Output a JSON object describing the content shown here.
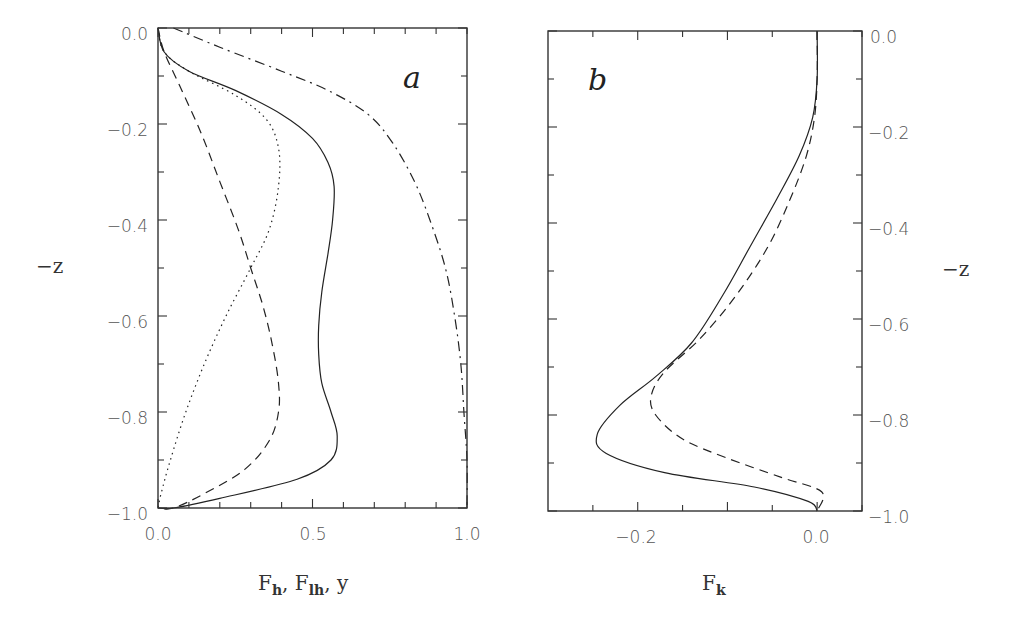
{
  "figure": {
    "panels": [
      {
        "id": "a",
        "letter": "a",
        "xlabel": {
          "main1": "F",
          "sub1": "h",
          "sep1": ", ",
          "main2": "F",
          "sub2": "lh",
          "sep2": ", ",
          "main3": "y"
        },
        "ylabel": "−z",
        "xticks": [
          "0.0",
          "0.5",
          "1.0"
        ],
        "yticks": [
          "0.0",
          "−0.2",
          "−0.4",
          "−0.6",
          "−0.8",
          "−1.0"
        ]
      },
      {
        "id": "b",
        "letter": "b",
        "xlabel": {
          "main1": "F",
          "sub1": "k"
        },
        "ylabel": "−z",
        "xticks": [
          "−0.2",
          "0.0"
        ],
        "yticks": [
          "0.0",
          "−0.2",
          "−0.4",
          "−0.6",
          "−0.8",
          "−1.0"
        ]
      }
    ]
  },
  "chart_data": [
    {
      "type": "line",
      "panel": "a",
      "title": "a",
      "xlabel": "F_h, F_lh, y",
      "ylabel": "-z",
      "xlim": [
        0.0,
        1.0
      ],
      "ylim": [
        -1.0,
        0.0
      ],
      "grid": false,
      "legend": "none",
      "x_ticks": [
        0.0,
        0.5,
        1.0
      ],
      "y_ticks": [
        0.0,
        -0.2,
        -0.4,
        -0.6,
        -0.8,
        -1.0
      ],
      "series": [
        {
          "name": "solid",
          "style": "solid",
          "points": [
            [
              0.0,
              0.0
            ],
            [
              0.02,
              -0.05
            ],
            [
              0.1,
              -0.09
            ],
            [
              0.25,
              -0.13
            ],
            [
              0.4,
              -0.18
            ],
            [
              0.5,
              -0.23
            ],
            [
              0.55,
              -0.28
            ],
            [
              0.57,
              -0.33
            ],
            [
              0.565,
              -0.4
            ],
            [
              0.55,
              -0.47
            ],
            [
              0.53,
              -0.55
            ],
            [
              0.52,
              -0.62
            ],
            [
              0.52,
              -0.68
            ],
            [
              0.53,
              -0.74
            ],
            [
              0.56,
              -0.8
            ],
            [
              0.58,
              -0.85
            ],
            [
              0.56,
              -0.9
            ],
            [
              0.45,
              -0.94
            ],
            [
              0.2,
              -0.98
            ],
            [
              0.05,
              -1.0
            ],
            [
              0.0,
              -1.0
            ]
          ]
        },
        {
          "name": "dashed",
          "style": "dashed",
          "points": [
            [
              0.0,
              0.0
            ],
            [
              0.02,
              -0.05
            ],
            [
              0.07,
              -0.12
            ],
            [
              0.14,
              -0.22
            ],
            [
              0.2,
              -0.32
            ],
            [
              0.26,
              -0.42
            ],
            [
              0.3,
              -0.5
            ],
            [
              0.34,
              -0.58
            ],
            [
              0.37,
              -0.66
            ],
            [
              0.39,
              -0.74
            ],
            [
              0.39,
              -0.8
            ],
            [
              0.36,
              -0.86
            ],
            [
              0.28,
              -0.92
            ],
            [
              0.15,
              -0.97
            ],
            [
              0.05,
              -1.0
            ],
            [
              0.0,
              -1.0
            ]
          ]
        },
        {
          "name": "dotted",
          "style": "dotted",
          "points": [
            [
              0.0,
              0.0
            ],
            [
              0.02,
              -0.05
            ],
            [
              0.1,
              -0.09
            ],
            [
              0.25,
              -0.14
            ],
            [
              0.35,
              -0.19
            ],
            [
              0.39,
              -0.25
            ],
            [
              0.39,
              -0.33
            ],
            [
              0.36,
              -0.42
            ],
            [
              0.3,
              -0.5
            ],
            [
              0.22,
              -0.6
            ],
            [
              0.15,
              -0.7
            ],
            [
              0.09,
              -0.8
            ],
            [
              0.04,
              -0.9
            ],
            [
              0.01,
              -0.97
            ],
            [
              0.0,
              -1.0
            ]
          ]
        },
        {
          "name": "dash-dot",
          "style": "dashdot",
          "points": [
            [
              0.05,
              0.0
            ],
            [
              0.2,
              -0.04
            ],
            [
              0.4,
              -0.09
            ],
            [
              0.55,
              -0.13
            ],
            [
              0.68,
              -0.18
            ],
            [
              0.76,
              -0.24
            ],
            [
              0.83,
              -0.32
            ],
            [
              0.88,
              -0.4
            ],
            [
              0.93,
              -0.5
            ],
            [
              0.96,
              -0.6
            ],
            [
              0.98,
              -0.7
            ],
            [
              0.99,
              -0.8
            ],
            [
              1.0,
              -0.9
            ],
            [
              1.0,
              -1.0
            ]
          ]
        }
      ]
    },
    {
      "type": "line",
      "panel": "b",
      "title": "b",
      "xlabel": "F_k",
      "ylabel": "-z",
      "xlim": [
        -0.3,
        0.05
      ],
      "ylim": [
        -1.0,
        0.0
      ],
      "grid": false,
      "legend": "none",
      "x_ticks": [
        -0.2,
        0.0
      ],
      "y_ticks": [
        0.0,
        -0.2,
        -0.4,
        -0.6,
        -0.8,
        -1.0
      ],
      "series": [
        {
          "name": "solid",
          "style": "solid",
          "points": [
            [
              0.0,
              0.0
            ],
            [
              0.0,
              -0.1
            ],
            [
              -0.005,
              -0.18
            ],
            [
              -0.02,
              -0.26
            ],
            [
              -0.045,
              -0.35
            ],
            [
              -0.075,
              -0.45
            ],
            [
              -0.105,
              -0.55
            ],
            [
              -0.14,
              -0.65
            ],
            [
              -0.18,
              -0.72
            ],
            [
              -0.22,
              -0.78
            ],
            [
              -0.245,
              -0.84
            ],
            [
              -0.235,
              -0.88
            ],
            [
              -0.17,
              -0.92
            ],
            [
              -0.07,
              -0.95
            ],
            [
              -0.01,
              -0.98
            ],
            [
              0.0,
              -1.0
            ]
          ]
        },
        {
          "name": "dashed",
          "style": "dashed",
          "points": [
            [
              0.0,
              0.0
            ],
            [
              0.0,
              -0.1
            ],
            [
              -0.003,
              -0.18
            ],
            [
              -0.012,
              -0.26
            ],
            [
              -0.03,
              -0.35
            ],
            [
              -0.055,
              -0.45
            ],
            [
              -0.09,
              -0.55
            ],
            [
              -0.13,
              -0.64
            ],
            [
              -0.17,
              -0.71
            ],
            [
              -0.185,
              -0.76
            ],
            [
              -0.18,
              -0.8
            ],
            [
              -0.15,
              -0.85
            ],
            [
              -0.1,
              -0.89
            ],
            [
              -0.04,
              -0.93
            ],
            [
              0.005,
              -0.96
            ],
            [
              0.0,
              -1.0
            ]
          ]
        }
      ]
    }
  ]
}
